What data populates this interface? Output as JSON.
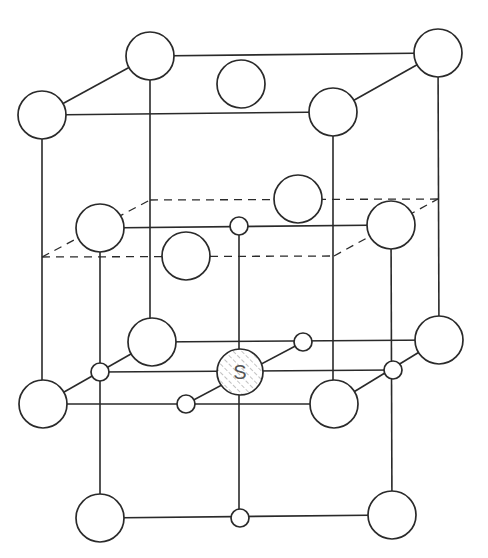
{
  "figure": {
    "center_label": "S",
    "colors": {
      "line": "#2a2a2a",
      "fill": "#ffffff",
      "hatch": "#aaaaaa",
      "label": "#555555"
    }
  },
  "atoms_large": [
    {
      "id": "top-back-left",
      "cx": 150,
      "cy": 56,
      "r": 24
    },
    {
      "id": "top-back-right",
      "cx": 438,
      "cy": 53,
      "r": 24
    },
    {
      "id": "top-front-left",
      "cx": 42,
      "cy": 115,
      "r": 24
    },
    {
      "id": "top-front-right",
      "cx": 333,
      "cy": 112,
      "r": 24
    },
    {
      "id": "top-face-center",
      "cx": 241,
      "cy": 84,
      "r": 24
    },
    {
      "id": "mid-back-face",
      "cx": 298,
      "cy": 199,
      "r": 24
    },
    {
      "id": "mid-left",
      "cx": 100,
      "cy": 228,
      "r": 24
    },
    {
      "id": "mid-right",
      "cx": 391,
      "cy": 225,
      "r": 24
    },
    {
      "id": "mid-front-face",
      "cx": 186,
      "cy": 256,
      "r": 24
    },
    {
      "id": "low-back-left",
      "cx": 152,
      "cy": 342,
      "r": 24
    },
    {
      "id": "low-back-right",
      "cx": 439,
      "cy": 340,
      "r": 24
    },
    {
      "id": "low-front-left",
      "cx": 43,
      "cy": 404,
      "r": 24
    },
    {
      "id": "low-front-right",
      "cx": 334,
      "cy": 404,
      "r": 24
    },
    {
      "id": "bottom-left",
      "cx": 100,
      "cy": 518,
      "r": 24
    },
    {
      "id": "bottom-right",
      "cx": 392,
      "cy": 515,
      "r": 24
    }
  ],
  "atoms_small": [
    {
      "id": "mid-center-small",
      "cx": 239,
      "cy": 226,
      "r": 9
    },
    {
      "id": "low-left-small",
      "cx": 100,
      "cy": 372,
      "r": 9
    },
    {
      "id": "low-back-small",
      "cx": 303,
      "cy": 342,
      "r": 9
    },
    {
      "id": "low-front-small",
      "cx": 186,
      "cy": 404,
      "r": 9
    },
    {
      "id": "low-right-small",
      "cx": 393,
      "cy": 370,
      "r": 9
    },
    {
      "id": "bottom-center-small",
      "cx": 240,
      "cy": 518,
      "r": 9
    }
  ],
  "atom_s": {
    "id": "center-S",
    "cx": 240,
    "cy": 372,
    "r": 23,
    "label": "S"
  },
  "solid_lines": [
    [
      150,
      56,
      438,
      53
    ],
    [
      42,
      115,
      333,
      112
    ],
    [
      42,
      115,
      150,
      56
    ],
    [
      333,
      112,
      438,
      53
    ],
    [
      42,
      115,
      42,
      404
    ],
    [
      150,
      56,
      150,
      342
    ],
    [
      333,
      112,
      333,
      404
    ],
    [
      438,
      53,
      439,
      340
    ],
    [
      100,
      228,
      391,
      225
    ],
    [
      100,
      228,
      100,
      518
    ],
    [
      239,
      226,
      239,
      518
    ],
    [
      391,
      225,
      392,
      515
    ],
    [
      100,
      518,
      392,
      515
    ],
    [
      43,
      404,
      334,
      404
    ],
    [
      152,
      342,
      439,
      340
    ],
    [
      100,
      372,
      393,
      370
    ],
    [
      43,
      404,
      152,
      342
    ],
    [
      186,
      404,
      303,
      342
    ],
    [
      334,
      404,
      439,
      340
    ]
  ],
  "dashed_lines": [
    [
      42,
      257,
      150,
      200
    ],
    [
      150,
      200,
      438,
      199
    ],
    [
      42,
      257,
      334,
      256
    ],
    [
      334,
      256,
      438,
      199
    ]
  ]
}
